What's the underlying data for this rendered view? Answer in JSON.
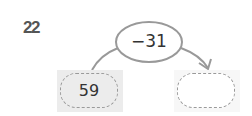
{
  "problem": {
    "number": "22",
    "start_value": "59",
    "operation": "−31",
    "answer_value": ""
  }
}
